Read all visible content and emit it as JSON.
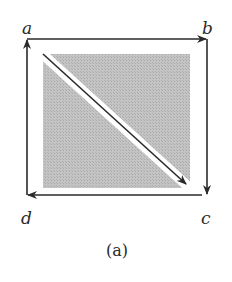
{
  "figure": {
    "caption": "(a)",
    "vertices": {
      "a": {
        "label": "a",
        "x": 27,
        "y": 39
      },
      "b": {
        "label": "b",
        "x": 207,
        "y": 39
      },
      "c": {
        "label": "c",
        "x": 207,
        "y": 195
      },
      "d": {
        "label": "d",
        "x": 27,
        "y": 195
      }
    },
    "edges": [
      {
        "from": "a",
        "to": "b"
      },
      {
        "from": "b",
        "to": "c"
      },
      {
        "from": "c",
        "to": "d"
      },
      {
        "from": "d",
        "to": "a"
      },
      {
        "from": "a",
        "to": "c",
        "type": "diagonal"
      }
    ],
    "colors": {
      "line": "#2a2a2a",
      "fill": "#bdbdbd",
      "background": "#ffffff"
    }
  }
}
